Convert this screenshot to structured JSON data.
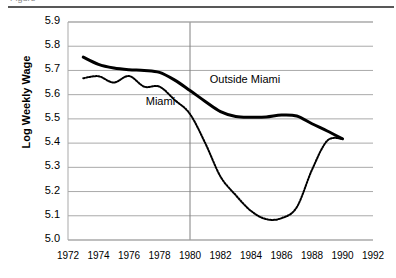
{
  "figure": {
    "top_crop_text": "Figure",
    "background": "#ffffff"
  },
  "chart_data": {
    "type": "line",
    "title": "",
    "subtitle": "",
    "xlabel": "",
    "ylabel": "Log Weekly Wage",
    "xlim": [
      1972,
      1992
    ],
    "ylim": [
      5.0,
      5.9
    ],
    "grid": "horizontal",
    "legend_position": "inline-annotations",
    "xticks": [
      1972,
      1974,
      1976,
      1978,
      1980,
      1982,
      1984,
      1986,
      1988,
      1990,
      1992
    ],
    "xtick_labels": [
      "1972",
      "1974",
      "1976",
      "1978",
      "1980",
      "1982",
      "1984",
      "1986",
      "1988",
      "1990",
      "1992"
    ],
    "yticks": [
      5.0,
      5.1,
      5.2,
      5.3,
      5.4,
      5.5,
      5.6,
      5.7,
      5.8,
      5.9
    ],
    "ytick_labels": [
      "5.0",
      "5.1",
      "5.2",
      "5.3",
      "5.4",
      "5.5",
      "5.6",
      "5.7",
      "5.8",
      "5.9"
    ],
    "annotations": [
      {
        "text": "Outside Miami",
        "x": 1981.3,
        "y": 5.655
      },
      {
        "text": "Miami",
        "x": 1977.1,
        "y": 5.565
      }
    ],
    "reference_lines": [
      {
        "orientation": "vertical",
        "x": 1980,
        "color": "#808080",
        "width": 1
      }
    ],
    "series": [
      {
        "name": "Outside Miami",
        "style": "solid",
        "color": "#000000",
        "width": 3,
        "x": [
          1973,
          1974,
          1975,
          1976,
          1977,
          1978,
          1979,
          1980,
          1981,
          1982,
          1983,
          1984,
          1985,
          1986,
          1987,
          1988,
          1989,
          1990
        ],
        "values": [
          5.755,
          5.725,
          5.71,
          5.703,
          5.7,
          5.692,
          5.66,
          5.617,
          5.572,
          5.53,
          5.51,
          5.507,
          5.508,
          5.516,
          5.512,
          5.48,
          5.45,
          5.418
        ]
      },
      {
        "name": "Miami",
        "style": "dotted",
        "color": "#000000",
        "width": 2,
        "x": [
          1973,
          1974,
          1975,
          1976,
          1977,
          1978,
          1979,
          1980,
          1981,
          1982,
          1983,
          1984,
          1985,
          1986,
          1987,
          1988,
          1989,
          1990
        ],
        "values": [
          5.668,
          5.676,
          5.65,
          5.677,
          5.633,
          5.633,
          5.578,
          5.52,
          5.4,
          5.262,
          5.185,
          5.12,
          5.086,
          5.09,
          5.135,
          5.29,
          5.41,
          5.418
        ]
      }
    ]
  },
  "axes_geometry": {
    "note": "pixel mapping used to render the plot area",
    "left": 68,
    "right": 373,
    "top": 22,
    "bottom": 240
  }
}
